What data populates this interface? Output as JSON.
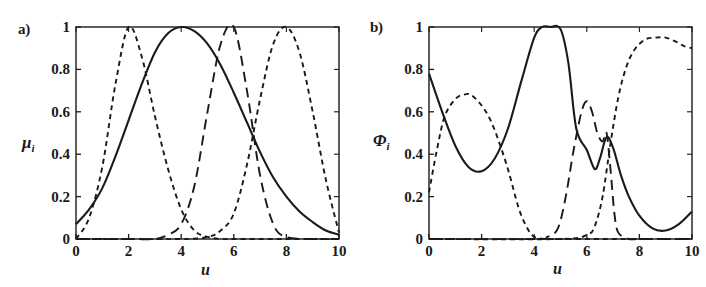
{
  "figure": {
    "background": "#ffffff",
    "ink_color": "#1a1a1a"
  },
  "panels": [
    {
      "id": "a",
      "label": "a)",
      "ylabel_main": "μ",
      "ylabel_sub": "i",
      "xlabel": "u"
    },
    {
      "id": "b",
      "label": "b)",
      "ylabel_main": "Φ",
      "ylabel_sub": "i",
      "xlabel": "u"
    }
  ],
  "chart_data": [
    {
      "type": "line",
      "panel": "a",
      "title": "",
      "xlabel": "u",
      "ylabel": "μ_i",
      "xlim": [
        0,
        10
      ],
      "ylim": [
        0,
        1
      ],
      "grid": false,
      "legend": "none",
      "xticks": [
        0,
        2,
        4,
        6,
        8,
        10
      ],
      "xticklabels": [
        "0",
        "2",
        "4",
        "6",
        "8",
        "10"
      ],
      "yticks": [
        0,
        0.2,
        0.4,
        0.6,
        0.8,
        1
      ],
      "yticklabels": [
        "0",
        "0.2",
        "0.4",
        "0.6",
        "0.8",
        "1"
      ],
      "series": [
        {
          "name": "mu-broad-solid",
          "style": "solid",
          "comment": "Wide bell centred at u=4, value 0.07 at u=0, long tail to 0 at u=10",
          "x": [
            0,
            0.5,
            1,
            1.5,
            2,
            2.5,
            3,
            3.5,
            4,
            4.5,
            5,
            5.5,
            6,
            6.5,
            7,
            7.5,
            8,
            8.5,
            9,
            9.5,
            10
          ],
          "values": [
            0.07,
            0.14,
            0.24,
            0.39,
            0.56,
            0.73,
            0.88,
            0.97,
            1.0,
            0.98,
            0.92,
            0.82,
            0.69,
            0.55,
            0.41,
            0.29,
            0.2,
            0.13,
            0.08,
            0.04,
            0.02
          ]
        },
        {
          "name": "mu-peak-2-shortdash",
          "style": "short-dash",
          "comment": "Narrow bell centred at u=2, peak 1.0, zero beyond u=4.8",
          "x": [
            0,
            0.5,
            1,
            1.5,
            2,
            2.5,
            3,
            3.5,
            4,
            4.5,
            5,
            5.5,
            6,
            7,
            8,
            9,
            10
          ],
          "values": [
            0.0,
            0.1,
            0.34,
            0.73,
            1.0,
            0.86,
            0.58,
            0.33,
            0.14,
            0.04,
            0.01,
            0.0,
            0.0,
            0.0,
            0.0,
            0.0,
            0.0
          ]
        },
        {
          "name": "mu-peak-6-longdash",
          "style": "long-dash",
          "comment": "Narrow bell centred at u=6, peak 1.0",
          "x": [
            0,
            2,
            3,
            3.5,
            4,
            4.5,
            5,
            5.5,
            6,
            6.5,
            7,
            7.5,
            8,
            9,
            10
          ],
          "values": [
            0.0,
            0.0,
            0.0,
            0.02,
            0.07,
            0.25,
            0.6,
            0.92,
            1.0,
            0.7,
            0.3,
            0.07,
            0.01,
            0.0,
            0.0
          ]
        },
        {
          "name": "mu-peak-8-shortdash",
          "style": "short-dash",
          "comment": "Narrow bell centred at u=8, peak 1.0, decays to 0 at u=10",
          "x": [
            0,
            4,
            5,
            5.5,
            6,
            6.5,
            7,
            7.5,
            8,
            8.5,
            9,
            9.5,
            10
          ],
          "values": [
            0.0,
            0.0,
            0.01,
            0.04,
            0.12,
            0.35,
            0.66,
            0.92,
            1.0,
            0.88,
            0.6,
            0.28,
            0.03
          ]
        }
      ]
    },
    {
      "type": "line",
      "panel": "b",
      "title": "",
      "xlabel": "u",
      "ylabel": "Φ_i",
      "xlim": [
        0,
        10
      ],
      "ylim": [
        0,
        1
      ],
      "grid": false,
      "legend": "none",
      "xticks": [
        0,
        2,
        4,
        6,
        8,
        10
      ],
      "xticklabels": [
        "0",
        "2",
        "4",
        "6",
        "8",
        "10"
      ],
      "yticks": [
        0,
        0.2,
        0.4,
        0.6,
        0.8,
        1
      ],
      "yticklabels": [
        "0",
        "0.2",
        "0.4",
        "0.6",
        "0.8",
        "1"
      ],
      "series": [
        {
          "name": "phi-solid",
          "style": "solid",
          "comment": "Starts 0.78, min 0.32 near u=1.7, flat top 1.0 for u=4.2-5.0, drops, local min 0.33 at u=6.3, bump 0.48 at u=6.75, falls to 0.04 near u=8.7, rises to 0.13 at u=10",
          "x": [
            0,
            0.5,
            1,
            1.5,
            2,
            2.5,
            3,
            3.5,
            4,
            4.3,
            4.6,
            5,
            5.3,
            5.6,
            6,
            6.3,
            6.5,
            6.75,
            7,
            7.3,
            7.6,
            8,
            8.5,
            9,
            9.5,
            10
          ],
          "values": [
            0.78,
            0.6,
            0.44,
            0.34,
            0.32,
            0.38,
            0.52,
            0.74,
            0.95,
            1.0,
            1.0,
            0.99,
            0.83,
            0.52,
            0.42,
            0.33,
            0.38,
            0.48,
            0.43,
            0.3,
            0.2,
            0.11,
            0.05,
            0.04,
            0.07,
            0.13
          ]
        },
        {
          "name": "phi-dash-left",
          "style": "short-dash",
          "comment": "Starts 0.22, rises to 0.68 plateau near u=1.6, decays to 0 by u=3.9",
          "x": [
            0,
            0.3,
            0.6,
            1,
            1.3,
            1.6,
            2,
            2.3,
            2.6,
            3,
            3.4,
            3.7,
            4,
            4.5,
            5,
            6,
            7,
            8,
            9,
            10
          ],
          "values": [
            0.22,
            0.42,
            0.58,
            0.66,
            0.68,
            0.68,
            0.63,
            0.57,
            0.48,
            0.33,
            0.15,
            0.06,
            0.01,
            0.0,
            0.0,
            0.0,
            0.0,
            0.0,
            0.0,
            0.0
          ]
        },
        {
          "name": "phi-dash-mid",
          "style": "long-dash",
          "comment": "Rises from 0 near u=4.9, local peak 0.65 at u=6.0, dip 0.5 at u=6.4, sharp spike 0.5 near u=6.7, drops to 0 by u=7.1",
          "x": [
            0,
            4,
            4.5,
            4.9,
            5.2,
            5.5,
            5.8,
            6,
            6.2,
            6.4,
            6.6,
            6.75,
            6.9,
            7.05,
            7.2,
            7.6,
            8,
            9,
            10
          ],
          "values": [
            0.0,
            0.0,
            0.01,
            0.05,
            0.2,
            0.42,
            0.6,
            0.65,
            0.6,
            0.5,
            0.46,
            0.5,
            0.33,
            0.12,
            0.03,
            0.0,
            0.0,
            0.0,
            0.0
          ]
        },
        {
          "name": "phi-dash-right",
          "style": "short-dash",
          "comment": "Rises steeply from 0 near u=6.3, plateau 0.95 over u=8.2-9.2, slight fall to 0.9 at u=10",
          "x": [
            0,
            5,
            6,
            6.3,
            6.6,
            6.9,
            7.2,
            7.5,
            7.8,
            8.2,
            8.6,
            9,
            9.4,
            9.7,
            10
          ],
          "values": [
            0.0,
            0.0,
            0.02,
            0.06,
            0.2,
            0.45,
            0.67,
            0.81,
            0.89,
            0.94,
            0.95,
            0.95,
            0.93,
            0.91,
            0.9
          ]
        }
      ]
    }
  ]
}
